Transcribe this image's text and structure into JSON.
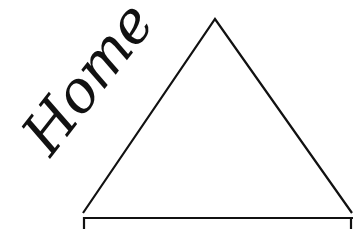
{
  "label": {
    "text": "Home"
  },
  "drawing": {
    "stroke_color": "#111111",
    "background": "#ffffff",
    "roof": {
      "apex": [
        215,
        19
      ],
      "left_base": [
        83,
        213
      ],
      "right_base": [
        352,
        213
      ]
    },
    "house_top_edge": {
      "y": 217,
      "x_start": 83,
      "x_end": 352
    }
  }
}
